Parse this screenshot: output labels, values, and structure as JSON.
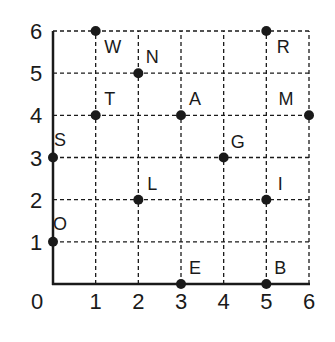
{
  "chart_data": {
    "type": "scatter",
    "title": "",
    "xlabel": "",
    "ylabel": "",
    "xlim": [
      0,
      6
    ],
    "ylim": [
      0,
      6
    ],
    "grid": true,
    "grid_style": "dashed",
    "x_ticks": [
      "0",
      "1",
      "2",
      "3",
      "4",
      "5",
      "6"
    ],
    "y_ticks": [
      "1",
      "2",
      "3",
      "4",
      "5",
      "6"
    ],
    "points": [
      {
        "label": "W",
        "x": 1,
        "y": 6
      },
      {
        "label": "N",
        "x": 2,
        "y": 5
      },
      {
        "label": "T",
        "x": 1,
        "y": 4
      },
      {
        "label": "S",
        "x": 0,
        "y": 3
      },
      {
        "label": "A",
        "x": 3,
        "y": 4
      },
      {
        "label": "R",
        "x": 5,
        "y": 6
      },
      {
        "label": "M",
        "x": 6,
        "y": 4
      },
      {
        "label": "G",
        "x": 4,
        "y": 3
      },
      {
        "label": "L",
        "x": 2,
        "y": 2
      },
      {
        "label": "I",
        "x": 5,
        "y": 2
      },
      {
        "label": "O",
        "x": 0,
        "y": 1
      },
      {
        "label": "E",
        "x": 3,
        "y": 0
      },
      {
        "label": "B",
        "x": 5,
        "y": 0
      }
    ]
  },
  "colors": {
    "ink": "#1a1a1a",
    "background": "#ffffff"
  }
}
